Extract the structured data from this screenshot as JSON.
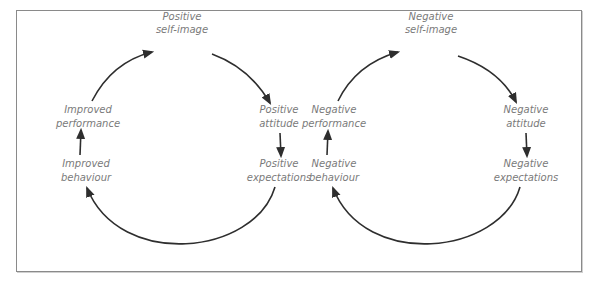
{
  "diagrams": {
    "positive": {
      "title": "Positive cycle",
      "nodes": [
        {
          "line1": "Positive",
          "line2": "self-image"
        },
        {
          "line1": "Positive",
          "line2": "attitude"
        },
        {
          "line1": "Positive",
          "line2": "expectations"
        },
        {
          "line1": "Improved",
          "line2": "behaviour"
        },
        {
          "line1": "Improved",
          "line2": "performance"
        }
      ]
    },
    "negative": {
      "title": "Negative cycle",
      "nodes": [
        {
          "line1": "Negative",
          "line2": "self-image"
        },
        {
          "line1": "Negative",
          "line2": "attitude"
        },
        {
          "line1": "Negative",
          "line2": "expectations"
        },
        {
          "line1": "Negative",
          "line2": "behaviour"
        },
        {
          "line1": "Negative",
          "line2": "performance"
        }
      ]
    }
  },
  "colors": {
    "label": "#7a7a7a",
    "arrow": "#2e2e2e",
    "border": "#8a8a8a"
  }
}
